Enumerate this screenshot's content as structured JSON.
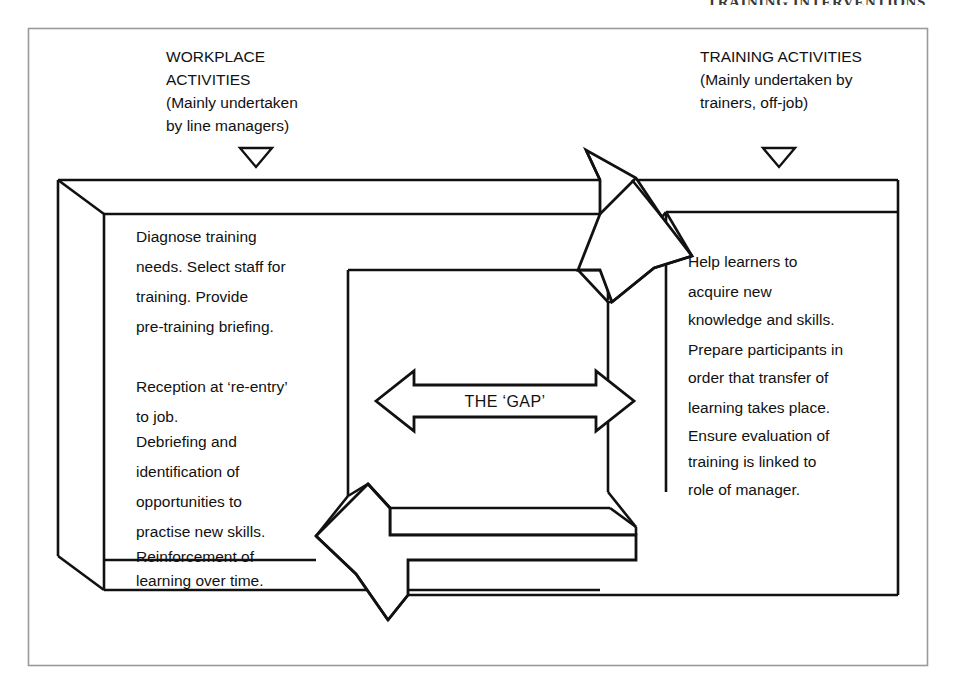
{
  "page": {
    "running_header": "TRAINING INTERVENTIONS",
    "background_color": "#ffffff",
    "ink_color": "#111111",
    "frame_color": "#9a9a9a"
  },
  "diagram": {
    "type": "process-flow-3d-blocks",
    "left_column": {
      "heading_lines": [
        "WORKPLACE",
        "ACTIVITIES",
        "(Mainly undertaken",
        "by line  managers)"
      ],
      "marker_icon": "down-triangle-icon",
      "body_paragraphs": [
        [
          "Diagnose training",
          "needs. Select staff for",
          "training. Provide",
          "pre-training briefing."
        ],
        [
          "Reception at ‘re-entry’",
          "to job.",
          "Debriefing and",
          "identification of",
          "opportunities to",
          "practise new skills.",
          "Reinforcement of",
          "learning over time."
        ]
      ]
    },
    "right_column": {
      "heading_lines": [
        "TRAINING ACTIVITIES",
        "(Mainly undertaken by",
        "trainers, off-job)"
      ],
      "marker_icon": "down-triangle-icon",
      "body_paragraphs": [
        [
          "Help learners to",
          "acquire new",
          "knowledge and skills.",
          "Prepare participants in",
          "order that transfer of",
          "learning takes place.",
          "Ensure evaluation of",
          "training is linked to",
          "role of manager."
        ]
      ]
    },
    "center": {
      "label": "THE ‘GAP’",
      "arrow_icon": "double-headed-horizontal-arrow-icon",
      "arrow_direction": "bidirectional"
    },
    "connectors": [
      {
        "name": "workplace-to-training-arrow",
        "icon": "block-arrow-down-right-icon",
        "direction": "down-right",
        "from": "workplace-activities",
        "to": "training-activities"
      },
      {
        "name": "training-to-workplace-arrow",
        "icon": "block-arrow-left-icon",
        "direction": "left",
        "from": "training-activities",
        "to": "workplace-activities"
      }
    ]
  }
}
